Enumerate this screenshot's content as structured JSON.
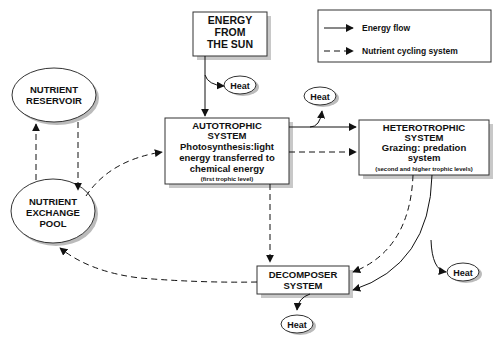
{
  "diagram": {
    "legend": {
      "energy_flow": "Energy flow",
      "nutrient_cycling": "Nutrient cycling system"
    },
    "nodes": {
      "sun": {
        "lines": [
          "ENERGY",
          "FROM",
          "THE SUN"
        ]
      },
      "autotrophic": {
        "lines": [
          "AUTOTROPHIC",
          "SYSTEM",
          "Photosynthesis:light",
          "energy transferred to",
          "chemical energy"
        ],
        "note": "(first trophic level)"
      },
      "heterotrophic": {
        "lines": [
          "HETEROTROPHIC",
          "SYSTEM",
          "Grazing: predation",
          "system"
        ],
        "note": "(second and higher trophic levels)"
      },
      "decomposer": {
        "lines": [
          "DECOMPOSER",
          "SYSTEM"
        ]
      },
      "reservoir": {
        "lines": [
          "NUTRIENT",
          "RESERVOIR"
        ]
      },
      "exchange": {
        "lines": [
          "NUTRIENT",
          "EXCHANGE",
          "POOL"
        ]
      },
      "heat": "Heat"
    },
    "colors": {
      "line": "#111111",
      "box_border": "#333333",
      "shadow": "#c8c8c8",
      "background": "#ffffff"
    }
  }
}
